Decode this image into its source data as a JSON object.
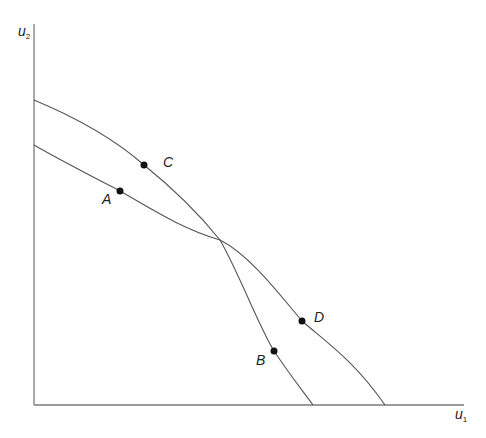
{
  "diagram": {
    "axes": {
      "x": {
        "label": "u",
        "subscript": "1"
      },
      "y": {
        "label": "u",
        "subscript": "2"
      }
    },
    "curves": [
      {
        "name": "frontier-CB",
        "description": "Higher intercept on u2 axis, steeper; passes through C and B"
      },
      {
        "name": "frontier-AD",
        "description": "Lower intercept on u2 axis, flatter; passes through A and D"
      }
    ],
    "points": [
      {
        "label": "A",
        "x": 120,
        "y": 191
      },
      {
        "label": "B",
        "x": 274,
        "y": 351
      },
      {
        "label": "C",
        "x": 144,
        "y": 165
      },
      {
        "label": "D",
        "x": 302,
        "y": 321
      }
    ],
    "colors": {
      "axis": "#7a7a7a",
      "curve": "#555555",
      "point": "#111111"
    }
  }
}
